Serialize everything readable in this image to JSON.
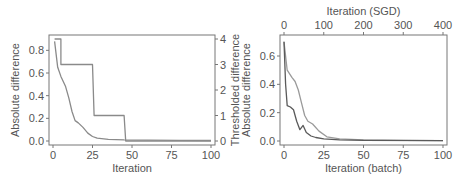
{
  "chart_data": [
    {
      "type": "line",
      "title": "",
      "xlabel": "Iteration",
      "ylabel": "Absolute difference",
      "ylabel_right": "Thresholded difference",
      "xlim": [
        0,
        100
      ],
      "ylim": [
        0,
        0.9
      ],
      "ylim_right": [
        0,
        4
      ],
      "xticks": [
        "0",
        "25",
        "50",
        "75",
        "100"
      ],
      "yticks": [
        "0.0",
        "0.2",
        "0.4",
        "0.6",
        "0.8"
      ],
      "yticks_right": [
        "0",
        "1",
        "2",
        "3",
        "4"
      ],
      "grid": false,
      "series": [
        {
          "name": "Absolute difference",
          "axis": "left",
          "x": [
            1,
            3,
            5,
            8,
            10,
            12,
            14,
            16,
            19,
            22,
            25,
            28,
            35,
            45,
            60,
            80,
            100
          ],
          "values": [
            0.88,
            0.65,
            0.57,
            0.48,
            0.38,
            0.26,
            0.18,
            0.16,
            0.12,
            0.07,
            0.04,
            0.025,
            0.015,
            0.01,
            0.007,
            0.005,
            0.004
          ]
        },
        {
          "name": "Thresholded difference",
          "axis": "right",
          "x": [
            1,
            5,
            5,
            25,
            26,
            45,
            46,
            100
          ],
          "values": [
            4,
            4,
            3,
            3,
            1,
            1,
            0,
            0
          ]
        }
      ]
    },
    {
      "type": "line",
      "title": "",
      "xlabel": "Iteration (batch)",
      "xlabel_top": "Iteration (SGD)",
      "ylabel": "Absolute difference",
      "xlim": [
        0,
        100
      ],
      "xlim_top": [
        0,
        400
      ],
      "ylim": [
        0,
        0.72
      ],
      "xticks": [
        "0",
        "25",
        "50",
        "75",
        "100"
      ],
      "xticks_top": [
        "0",
        "100",
        "200",
        "300",
        "400"
      ],
      "yticks": [
        "0.0",
        "0.2",
        "0.4",
        "0.6"
      ],
      "grid": false,
      "series": [
        {
          "name": "Batch",
          "x": [
            0,
            2,
            5,
            7,
            9,
            11,
            13,
            15,
            18,
            22,
            27,
            35,
            50,
            75,
            100
          ],
          "values": [
            0.7,
            0.5,
            0.45,
            0.42,
            0.36,
            0.27,
            0.18,
            0.14,
            0.12,
            0.07,
            0.03,
            0.015,
            0.008,
            0.005,
            0.003
          ]
        },
        {
          "name": "SGD",
          "x": [
            0,
            1,
            2,
            4,
            6,
            8,
            10,
            12,
            14,
            17,
            20,
            25,
            35,
            50,
            100
          ],
          "values": [
            0.7,
            0.4,
            0.25,
            0.24,
            0.22,
            0.14,
            0.08,
            0.11,
            0.06,
            0.035,
            0.025,
            0.015,
            0.008,
            0.005,
            0.003
          ]
        }
      ]
    }
  ]
}
